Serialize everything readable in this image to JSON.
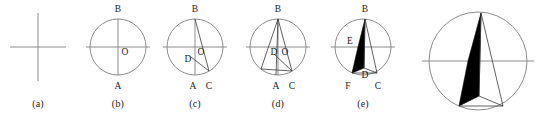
{
  "figure": {
    "background_color": "#ffffff",
    "stroke_color": "#8c8c8c",
    "chord_color": "#3a3a3a",
    "fill_color": "#000000",
    "label_color": "#1a1a1a"
  },
  "panels": [
    {
      "id": "a",
      "caption": "(a)",
      "kind": "crosshair",
      "center": {
        "x": 38,
        "y": 47
      },
      "half_width": 28,
      "half_height": 34,
      "point_labels": []
    },
    {
      "id": "b",
      "caption": "(b)",
      "kind": "circle-axes",
      "center": {
        "x": 118,
        "y": 47
      },
      "radius": 28,
      "point_labels": [
        {
          "name": "B",
          "x": 118,
          "y": 12
        },
        {
          "name": "O",
          "x": 125,
          "y": 52
        },
        {
          "name": "A",
          "x": 118,
          "y": 88
        }
      ]
    },
    {
      "id": "c",
      "caption": "(c)",
      "kind": "circle-chords-1",
      "center": {
        "x": 195,
        "y": 47
      },
      "radius": 28,
      "point_labels": [
        {
          "name": "B",
          "x": 195,
          "y": 12
        },
        {
          "name": "O",
          "x": 201,
          "y": 52
        },
        {
          "name": "D",
          "x": 189,
          "y": 60
        },
        {
          "name": "A",
          "x": 193,
          "y": 88
        },
        {
          "name": "C",
          "x": 209,
          "y": 88
        }
      ]
    },
    {
      "id": "d",
      "caption": "(d)",
      "kind": "circle-chords-2",
      "center": {
        "x": 278,
        "y": 47
      },
      "radius": 28,
      "point_labels": [
        {
          "name": "B",
          "x": 278,
          "y": 12
        },
        {
          "name": "O",
          "x": 284,
          "y": 52
        },
        {
          "name": "D",
          "x": 273,
          "y": 52
        },
        {
          "name": "A",
          "x": 276,
          "y": 88
        },
        {
          "name": "C",
          "x": 292,
          "y": 88
        }
      ]
    },
    {
      "id": "e",
      "caption": "(e)",
      "kind": "circle-filled-sliver",
      "center": {
        "x": 363,
        "y": 47
      },
      "radius": 28,
      "point_labels": [
        {
          "name": "B",
          "x": 365,
          "y": 12
        },
        {
          "name": "E",
          "x": 350,
          "y": 47
        },
        {
          "name": "D",
          "x": 363,
          "y": 77
        },
        {
          "name": "F",
          "x": 349,
          "y": 88
        },
        {
          "name": "C",
          "x": 377,
          "y": 88
        }
      ]
    },
    {
      "id": "final",
      "caption": "",
      "kind": "circle-filled-sliver-large",
      "center": {
        "x": 478,
        "y": 61
      },
      "radius": 49,
      "point_labels": []
    }
  ],
  "geometry_notes": {
    "panel_b": "Circle with vertical diameter A-B and horizontal diameter through center O; horizontal line extends past the circle.",
    "panel_c": "Adds chord B-C and segment D-C where C lies low-right on the circle and D sits just below-left of O.",
    "panel_d": "Adds a second fan of chords from B to a low-left point on the circle and to A, through D and O.",
    "panel_e": "Region B-E-F-D filled solid black; thin outlined triangle B-D-C remains white.",
    "panel_final": "Enlarged, unlabeled repeat of panel (e)."
  }
}
